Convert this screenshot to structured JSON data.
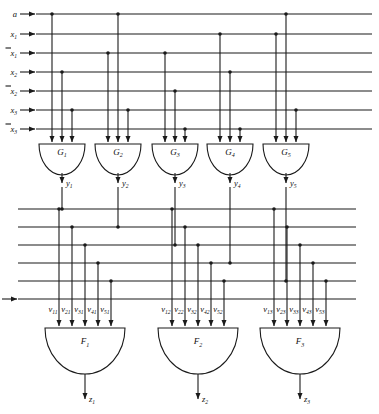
{
  "diagram": {
    "type": "logic-circuit-schematic",
    "colors": {
      "wire": "#1a1a1a",
      "background": "#ffffff",
      "gate_fill": "#ffffff"
    }
  },
  "inputs": {
    "bus_top_label": "top input bus",
    "lines": [
      {
        "id": "a",
        "base": "a",
        "bar": false,
        "sub": "",
        "y": 14
      },
      {
        "id": "x1",
        "base": "x",
        "bar": false,
        "sub": "1",
        "y": 34
      },
      {
        "id": "x1b",
        "base": "x",
        "bar": true,
        "sub": "1",
        "y": 53
      },
      {
        "id": "x2",
        "base": "x",
        "bar": false,
        "sub": "2",
        "y": 72
      },
      {
        "id": "x2b",
        "base": "x",
        "bar": true,
        "sub": "2",
        "y": 91
      },
      {
        "id": "x3",
        "base": "x",
        "bar": false,
        "sub": "3",
        "y": 110
      },
      {
        "id": "x3b",
        "base": "x",
        "bar": true,
        "sub": "3",
        "y": 129
      }
    ]
  },
  "and_gates": {
    "row_label": "AND gate row G",
    "gates": [
      {
        "name": "G",
        "sub": "1",
        "cx": 62,
        "out_base": "y",
        "out_sub": "1",
        "sources": [
          "a",
          "x2",
          "x3"
        ]
      },
      {
        "name": "G",
        "sub": "2",
        "cx": 118,
        "out_base": "y",
        "out_sub": "2",
        "sources": [
          "x1b",
          "a",
          "x3"
        ]
      },
      {
        "name": "G",
        "sub": "3",
        "cx": 175,
        "out_base": "y",
        "out_sub": "3",
        "sources": [
          "x1b",
          "x2b",
          "x3b"
        ]
      },
      {
        "name": "G",
        "sub": "4",
        "cx": 230,
        "out_base": "y",
        "out_sub": "4",
        "sources": [
          "x1",
          "x2",
          "x3b"
        ]
      },
      {
        "name": "G",
        "sub": "5",
        "cx": 286,
        "out_base": "y",
        "out_sub": "5",
        "sources": [
          "x1",
          "a",
          "x3"
        ]
      }
    ]
  },
  "middle_bus": {
    "label": "intermediate y bus",
    "lines": [
      {
        "id": "y1",
        "base": "y",
        "sub": "1",
        "y": 209
      },
      {
        "id": "y2",
        "base": "y",
        "sub": "2",
        "y": 227
      },
      {
        "id": "y3",
        "base": "y",
        "sub": "3",
        "y": 245
      },
      {
        "id": "y4",
        "base": "y",
        "sub": "4",
        "y": 263
      },
      {
        "id": "y5",
        "base": "y",
        "sub": "5",
        "y": 281
      }
    ],
    "control": {
      "id": "b",
      "base": "b",
      "bar": false,
      "sub": "",
      "y": 281
    }
  },
  "or_gates": {
    "row_label": "OR gate row F",
    "gates": [
      {
        "name": "F",
        "sub": "1",
        "cx": 85,
        "out_base": "z",
        "out_sub": "1",
        "inputs": [
          {
            "base": "v",
            "sub": "11",
            "src": "y1"
          },
          {
            "base": "v",
            "sub": "21",
            "src": "y2"
          },
          {
            "base": "v",
            "sub": "31",
            "src": "y3"
          },
          {
            "base": "v",
            "sub": "41",
            "src": "y4"
          },
          {
            "base": "v",
            "sub": "51",
            "src": "y5"
          }
        ]
      },
      {
        "name": "F",
        "sub": "2",
        "cx": 198,
        "out_base": "z",
        "out_sub": "2",
        "inputs": [
          {
            "base": "v",
            "sub": "12",
            "src": "y1"
          },
          {
            "base": "v",
            "sub": "22",
            "src": "y2"
          },
          {
            "base": "v",
            "sub": "32",
            "src": "y3"
          },
          {
            "base": "v",
            "sub": "42",
            "src": "y4"
          },
          {
            "base": "v",
            "sub": "52",
            "src": "y5"
          }
        ]
      },
      {
        "name": "F",
        "sub": "3",
        "cx": 300,
        "out_base": "z",
        "out_sub": "3",
        "inputs": [
          {
            "base": "v",
            "sub": "13",
            "src": "y1"
          },
          {
            "base": "v",
            "sub": "23",
            "src": "y2"
          },
          {
            "base": "v",
            "sub": "33",
            "src": "y3"
          },
          {
            "base": "v",
            "sub": "43",
            "src": "y4"
          },
          {
            "base": "v",
            "sub": "53",
            "src": "y5"
          }
        ]
      }
    ]
  },
  "outputs": {
    "label": "outputs z",
    "items": [
      {
        "base": "z",
        "sub": "1",
        "x": 85
      },
      {
        "base": "z",
        "sub": "2",
        "x": 198
      },
      {
        "base": "z",
        "sub": "3",
        "x": 300
      }
    ]
  }
}
